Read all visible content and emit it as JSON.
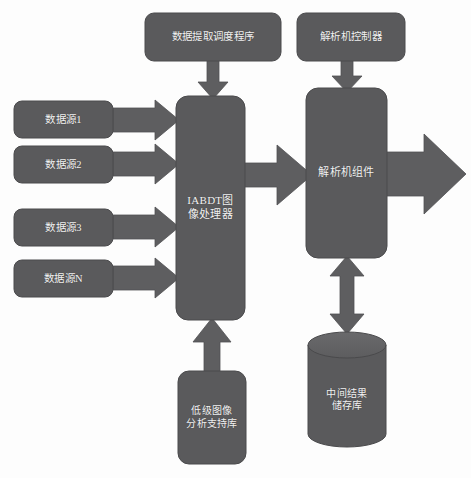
{
  "diagram": {
    "background_color": "#fdfdfd",
    "node_fill": "#5a5a5c",
    "node_stroke": "#4a4a4c",
    "arrow_fill": "#5e5e60",
    "label_color": "#f2f2f2",
    "nodes": {
      "extract_scheduler": {
        "label": "数据提取调度程序",
        "shape": "rounded-rect"
      },
      "parser_controller": {
        "label": "解析机控制器",
        "shape": "rounded-rect"
      },
      "source_1": {
        "label": "数据源1",
        "shape": "rounded-rect"
      },
      "source_2": {
        "label": "数据源2",
        "shape": "rounded-rect"
      },
      "source_3": {
        "label": "数据源3",
        "shape": "rounded-rect"
      },
      "source_n": {
        "label": "数据源N",
        "shape": "rounded-rect"
      },
      "image_processor": {
        "label_line1": "IABDT图",
        "label_line2": "像处理器",
        "shape": "rounded-rect"
      },
      "parser_component": {
        "label": "解析机组件",
        "shape": "rounded-rect"
      },
      "low_level_lib": {
        "label_line1": "低级图像",
        "label_line2": "分析支持库",
        "shape": "rounded-rect"
      },
      "intermediate_store": {
        "label_line1": "中间结果",
        "label_line2": "储存库",
        "shape": "cylinder"
      }
    },
    "arrows": {
      "scheduler_to_processor": {
        "name": "数据提取调度程序 → IABDT图像处理器",
        "direction": "down"
      },
      "controller_to_parser": {
        "name": "解析机控制器 → 解析机组件",
        "direction": "down"
      },
      "source1_to_processor": {
        "name": "数据源1 → IABDT图像处理器",
        "direction": "right"
      },
      "source2_to_processor": {
        "name": "数据源2 → IABDT图像处理器",
        "direction": "right"
      },
      "source3_to_processor": {
        "name": "数据源3 → IABDT图像处理器",
        "direction": "right"
      },
      "sourcen_to_processor": {
        "name": "数据源N → IABDT图像处理器",
        "direction": "right"
      },
      "processor_to_parser": {
        "name": "IABDT图像处理器 → 解析机组件",
        "direction": "right"
      },
      "parser_output": {
        "name": "解析机组件 → 输出",
        "direction": "right"
      },
      "parser_store_sync": {
        "name": "解析机组件 ↔ 中间结果储存库",
        "direction": "bidirectional-vertical"
      },
      "lib_to_processor": {
        "name": "低级图像分析支持库 → IABDT图像处理器",
        "direction": "up"
      }
    }
  }
}
